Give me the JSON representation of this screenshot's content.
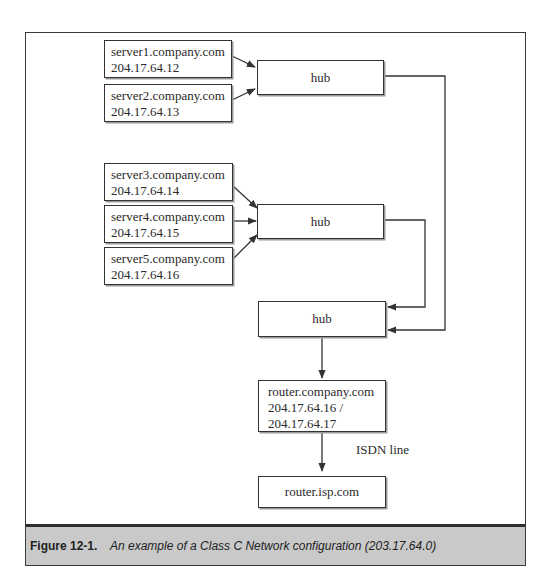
{
  "diagram": {
    "type": "network-topology",
    "nodes": {
      "server1": {
        "hostname": "server1.company.com",
        "ip": "204.17.64.12"
      },
      "server2": {
        "hostname": "server2.company.com",
        "ip": "204.17.64.13"
      },
      "server3": {
        "hostname": "server3.company.com",
        "ip": "204.17.64.14"
      },
      "server4": {
        "hostname": "server4.company.com",
        "ip": "204.17.64.15"
      },
      "server5": {
        "hostname": "server5.company.com",
        "ip": "204.17.64.16"
      },
      "hub1": {
        "label": "hub"
      },
      "hub2": {
        "label": "hub"
      },
      "hub3": {
        "label": "hub"
      },
      "router_company": {
        "hostname": "router.company.com",
        "ip_line1": "204.17.64.16 /",
        "ip_line2": "204.17.64.17"
      },
      "router_isp": {
        "label": "router.isp.com"
      }
    },
    "edges": [
      {
        "from": "server1",
        "to": "hub1"
      },
      {
        "from": "server2",
        "to": "hub1"
      },
      {
        "from": "server3",
        "to": "hub2"
      },
      {
        "from": "server4",
        "to": "hub2"
      },
      {
        "from": "server5",
        "to": "hub2"
      },
      {
        "from": "hub2",
        "to": "hub3"
      },
      {
        "from": "hub1",
        "to": "hub3"
      },
      {
        "from": "hub3",
        "to": "router_company"
      },
      {
        "from": "router_company",
        "to": "router_isp",
        "label": "ISDN line"
      }
    ],
    "edge_labels": {
      "isdn": "ISDN line"
    }
  },
  "caption": {
    "number": "Figure 12-1.",
    "text": "An example of a Class C Network configuration (203.17.64.0)"
  },
  "colors": {
    "caption_background": "#c9c9c9",
    "border": "#333333",
    "text": "#2a2a2a"
  }
}
